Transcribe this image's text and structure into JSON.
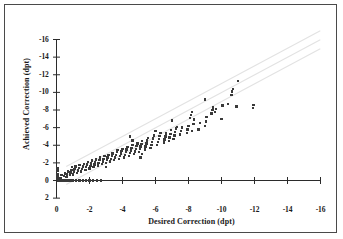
{
  "figure": {
    "border_color": "#4a4a4a",
    "background": "#ffffff"
  },
  "chart_data": {
    "type": "scatter",
    "title": "",
    "xlabel": "Desired Correction (dpt)",
    "ylabel": "Achieved Correction (dpt)",
    "xlim": [
      0,
      -16
    ],
    "ylim": [
      2,
      -16
    ],
    "xticks": [
      "0",
      "-2",
      "-4",
      "-6",
      "-8",
      "-10",
      "-12",
      "-14",
      "-16"
    ],
    "xtick_values": [
      0,
      -2,
      -4,
      -6,
      -8,
      -10,
      -12,
      -14,
      -16
    ],
    "yticks": [
      "-16",
      "-14",
      "-12",
      "-10",
      "-8",
      "-6",
      "-4",
      "-2",
      "0",
      "2"
    ],
    "ytick_values": [
      -16,
      -14,
      -12,
      -10,
      -8,
      -6,
      -4,
      -2,
      0,
      2
    ],
    "grid": false,
    "legend": "none",
    "point_color": "#3a3a3a",
    "point_marker": "square",
    "reference_lines": [
      {
        "name": "identity-plus-offset",
        "slope": 1.0,
        "intercept": -1.0,
        "color": "#e2e2e2"
      },
      {
        "name": "identity",
        "slope": 1.0,
        "intercept": 0.0,
        "color": "#e2e2e2"
      },
      {
        "name": "identity-minus-offset",
        "slope": 1.0,
        "intercept": 1.0,
        "color": "#e2e2e2"
      }
    ],
    "points": [
      [
        -0.1,
        0.0
      ],
      [
        -0.25,
        0.0
      ],
      [
        -0.4,
        0.0
      ],
      [
        -0.55,
        0.0
      ],
      [
        -0.7,
        0.0
      ],
      [
        -0.85,
        0.0
      ],
      [
        -1.0,
        0.0
      ],
      [
        -1.2,
        0.0
      ],
      [
        -1.4,
        0.0
      ],
      [
        -1.6,
        0.0
      ],
      [
        -1.8,
        0.0
      ],
      [
        -2.0,
        0.0
      ],
      [
        -2.2,
        0.0
      ],
      [
        -2.45,
        0.0
      ],
      [
        -2.7,
        0.0
      ],
      [
        -0.05,
        -0.15
      ],
      [
        -0.05,
        -0.45
      ],
      [
        -0.05,
        -0.75
      ],
      [
        -0.05,
        -1.05
      ],
      [
        -0.05,
        -1.35
      ],
      [
        -0.25,
        -0.3
      ],
      [
        -0.3,
        -0.6
      ],
      [
        -0.45,
        -0.5
      ],
      [
        -0.5,
        -0.8
      ],
      [
        -0.6,
        -0.4
      ],
      [
        -0.65,
        -0.7
      ],
      [
        -0.7,
        -1.0
      ],
      [
        -0.8,
        -0.6
      ],
      [
        -0.85,
        -0.9
      ],
      [
        -0.9,
        -1.2
      ],
      [
        -0.95,
        -1.5
      ],
      [
        -1.0,
        -0.7
      ],
      [
        -1.05,
        -1.0
      ],
      [
        -1.1,
        -1.3
      ],
      [
        -1.15,
        -1.6
      ],
      [
        -1.25,
        -0.85
      ],
      [
        -1.3,
        -1.15
      ],
      [
        -1.35,
        -1.45
      ],
      [
        -1.4,
        -1.75
      ],
      [
        -1.5,
        -1.0
      ],
      [
        -1.55,
        -1.3
      ],
      [
        -1.6,
        -1.6
      ],
      [
        -1.65,
        -1.9
      ],
      [
        -1.75,
        -1.2
      ],
      [
        -1.8,
        -1.5
      ],
      [
        -1.85,
        -1.8
      ],
      [
        -1.9,
        -2.1
      ],
      [
        -2.0,
        -1.35
      ],
      [
        -2.05,
        -1.65
      ],
      [
        -2.1,
        -1.95
      ],
      [
        -2.15,
        -2.25
      ],
      [
        -2.25,
        -1.5
      ],
      [
        -2.3,
        -1.8
      ],
      [
        -2.35,
        -2.1
      ],
      [
        -2.4,
        -2.4
      ],
      [
        -2.5,
        -1.7
      ],
      [
        -2.55,
        -2.0
      ],
      [
        -2.6,
        -2.3
      ],
      [
        -2.65,
        -2.6
      ],
      [
        -2.75,
        -1.85
      ],
      [
        -2.8,
        -2.15
      ],
      [
        -2.85,
        -2.45
      ],
      [
        -2.9,
        -2.75
      ],
      [
        -3.0,
        -1.55
      ],
      [
        -3.0,
        -2.0
      ],
      [
        -3.05,
        -2.3
      ],
      [
        -3.1,
        -2.6
      ],
      [
        -3.15,
        -2.9
      ],
      [
        -3.25,
        -2.15
      ],
      [
        -3.3,
        -2.45
      ],
      [
        -3.35,
        -2.75
      ],
      [
        -3.4,
        -3.05
      ],
      [
        -3.5,
        -2.3
      ],
      [
        -3.55,
        -2.6
      ],
      [
        -3.6,
        -2.9
      ],
      [
        -3.65,
        -3.2
      ],
      [
        -3.7,
        -3.45
      ],
      [
        -3.8,
        -2.45
      ],
      [
        -3.85,
        -2.75
      ],
      [
        -3.9,
        -3.05
      ],
      [
        -3.95,
        -3.35
      ],
      [
        -4.0,
        -3.6
      ],
      [
        -4.1,
        -2.6
      ],
      [
        -4.15,
        -2.9
      ],
      [
        -4.2,
        -3.2
      ],
      [
        -4.25,
        -3.5
      ],
      [
        -4.3,
        -3.8
      ],
      [
        -4.4,
        -2.8
      ],
      [
        -4.45,
        -3.1
      ],
      [
        -4.5,
        -3.4
      ],
      [
        -4.55,
        -3.7
      ],
      [
        -4.6,
        -4.0
      ],
      [
        -4.7,
        -3.0
      ],
      [
        -4.75,
        -3.3
      ],
      [
        -4.8,
        -3.6
      ],
      [
        -4.85,
        -3.9
      ],
      [
        -4.9,
        -4.2
      ],
      [
        -4.45,
        -5.0
      ],
      [
        -4.6,
        -4.55
      ],
      [
        -5.0,
        -3.2
      ],
      [
        -5.05,
        -3.55
      ],
      [
        -5.1,
        -3.85
      ],
      [
        -5.15,
        -4.15
      ],
      [
        -5.2,
        -4.45
      ],
      [
        -5.1,
        -2.6
      ],
      [
        -5.2,
        -3.0
      ],
      [
        -5.35,
        -3.5
      ],
      [
        -5.4,
        -3.85
      ],
      [
        -5.45,
        -4.2
      ],
      [
        -5.5,
        -4.55
      ],
      [
        -5.55,
        -4.85
      ],
      [
        -5.7,
        -3.7
      ],
      [
        -5.75,
        -4.05
      ],
      [
        -5.8,
        -4.4
      ],
      [
        -5.85,
        -4.75
      ],
      [
        -5.9,
        -5.1
      ],
      [
        -6.1,
        -4.0
      ],
      [
        -6.15,
        -4.35
      ],
      [
        -6.2,
        -4.7
      ],
      [
        -6.25,
        -5.05
      ],
      [
        -6.3,
        -5.4
      ],
      [
        -6.5,
        -4.3
      ],
      [
        -6.55,
        -4.65
      ],
      [
        -6.6,
        -5.0
      ],
      [
        -6.65,
        -5.35
      ],
      [
        -6.8,
        -4.5
      ],
      [
        -6.85,
        -4.9
      ],
      [
        -6.9,
        -5.3
      ],
      [
        -6.95,
        -5.7
      ],
      [
        -7.1,
        -4.7
      ],
      [
        -7.15,
        -5.1
      ],
      [
        -7.2,
        -5.5
      ],
      [
        -7.25,
        -5.9
      ],
      [
        -7.3,
        -6.1
      ],
      [
        -7.5,
        -5.2
      ],
      [
        -7.55,
        -5.6
      ],
      [
        -7.6,
        -6.0
      ],
      [
        -7.9,
        -5.4
      ],
      [
        -7.95,
        -5.8
      ],
      [
        -8.0,
        -6.2
      ],
      [
        -8.2,
        -5.6
      ],
      [
        -8.3,
        -6.4
      ],
      [
        -8.35,
        -6.9
      ],
      [
        -8.6,
        -5.8
      ],
      [
        -8.7,
        -6.5
      ],
      [
        -9.0,
        -6.2
      ],
      [
        -9.05,
        -6.7
      ],
      [
        -9.1,
        -7.2
      ],
      [
        -9.4,
        -7.6
      ],
      [
        -9.45,
        -8.0
      ],
      [
        -9.5,
        -8.3
      ],
      [
        -9.0,
        -9.2
      ],
      [
        -9.6,
        -7.8
      ],
      [
        -9.65,
        -8.1
      ],
      [
        -10.0,
        -7.0
      ],
      [
        -10.05,
        -8.5
      ],
      [
        -10.4,
        -8.7
      ],
      [
        -10.6,
        -9.7
      ],
      [
        -10.65,
        -10.1
      ],
      [
        -10.7,
        -10.4
      ],
      [
        -11.0,
        -11.3
      ],
      [
        -11.9,
        -8.2
      ],
      [
        -11.95,
        -8.6
      ],
      [
        -10.9,
        -8.4
      ],
      [
        -8.1,
        -7.1
      ],
      [
        -8.15,
        -7.45
      ],
      [
        -8.2,
        -7.8
      ],
      [
        -7.0,
        -6.8
      ],
      [
        -6.0,
        -5.6
      ]
    ]
  }
}
